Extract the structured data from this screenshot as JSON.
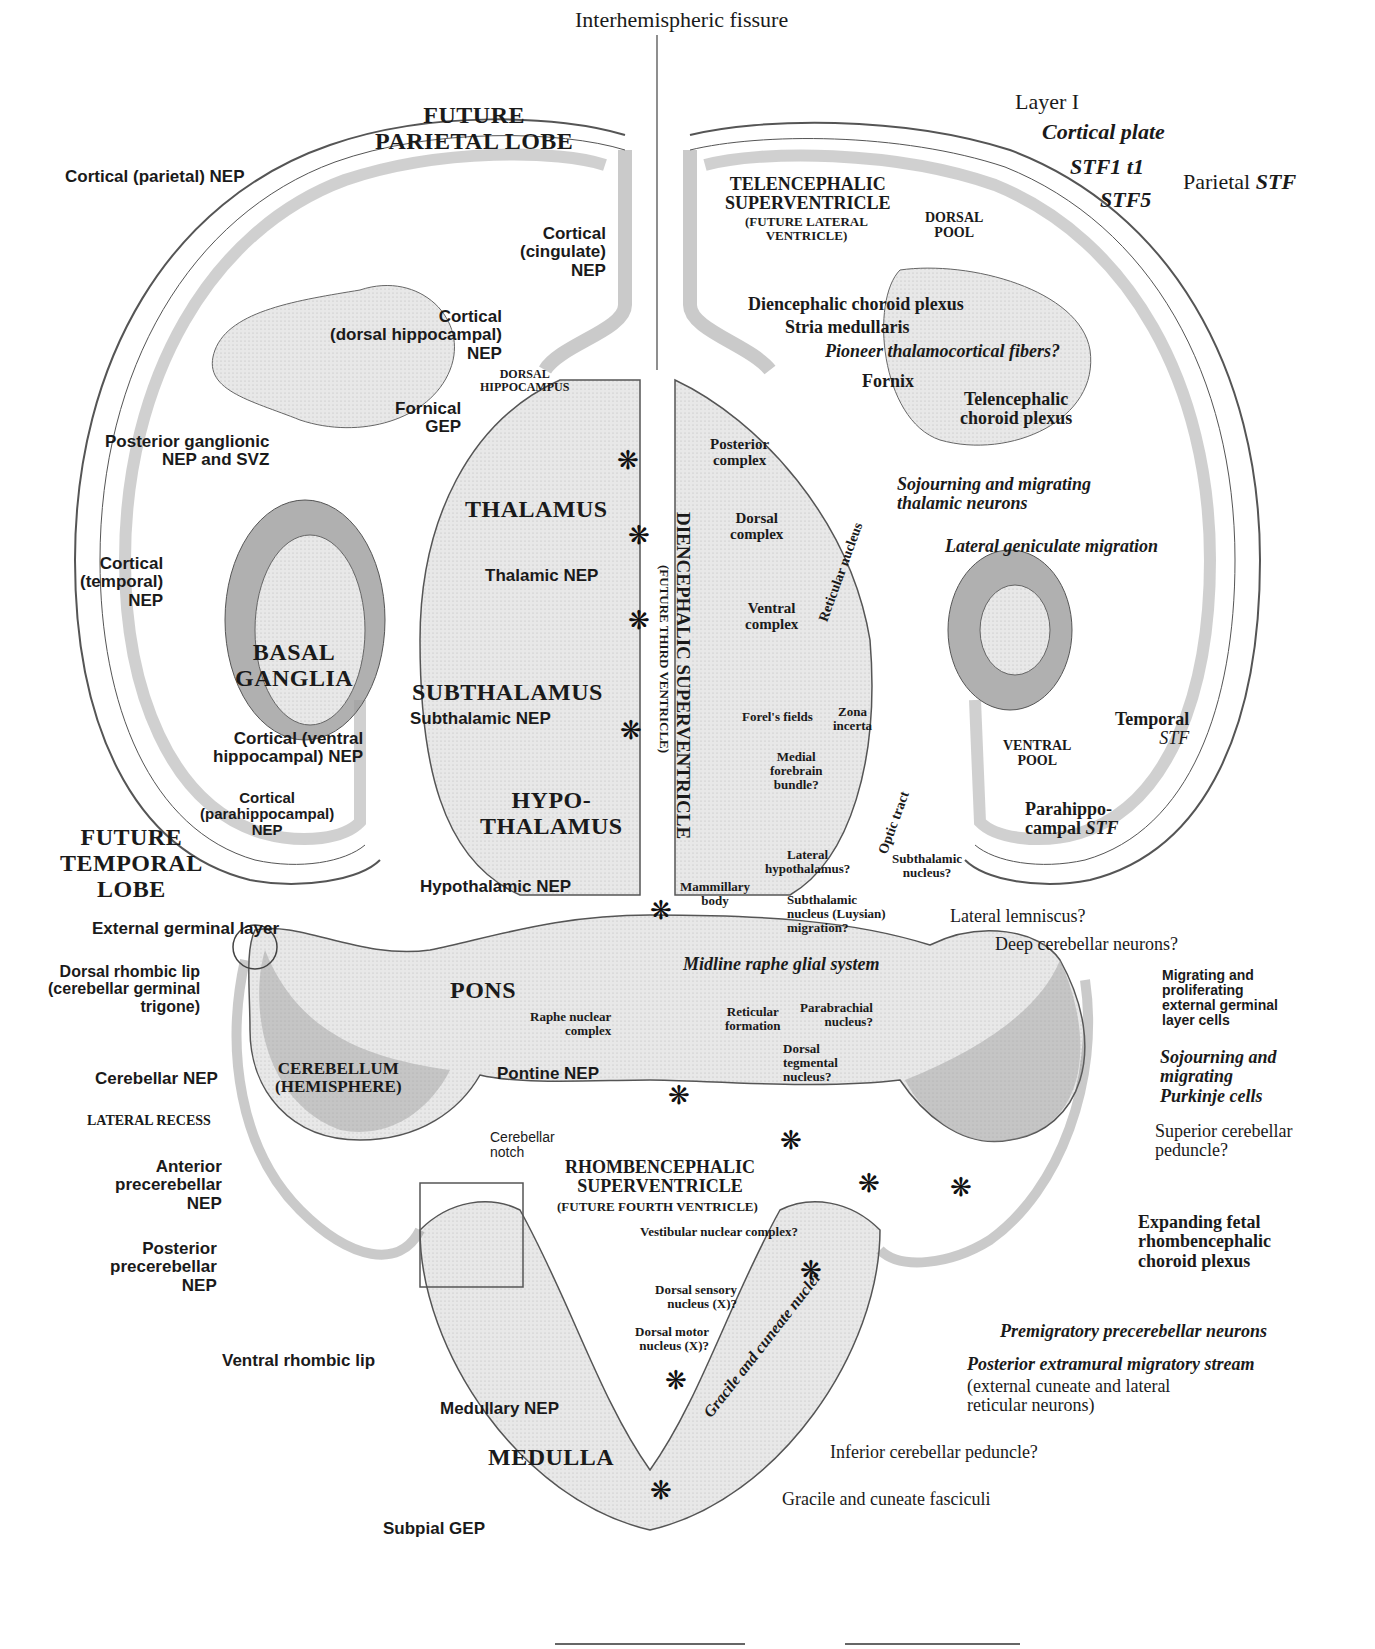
{
  "diagram": {
    "colors": {
      "tissue_light": "#e6e6e6",
      "tissue_dark": "#9c9c9c",
      "outline": "#555555",
      "text": "#1a1a1a",
      "background": "#ffffff"
    },
    "top": {
      "interhemispheric": "Interhemispheric fissure",
      "parietal_lobe": "FUTURE\nPARIETAL LOBE",
      "layer1": "Layer I",
      "cortical_plate": "Cortical plate",
      "stf1": "STF1 t1",
      "stf5": "STF5",
      "parietal_stf_prefix": "Parietal ",
      "parietal_stf_suffix": "STF",
      "tel_superventricle": "TELENCEPHALIC\nSUPERVENTRICLE",
      "tel_future": "(FUTURE LATERAL\nVENTRICLE)",
      "dorsal_pool": "DORSAL\nPOOL"
    },
    "left": {
      "cortical_parietal": "Cortical (parietal) NEP",
      "cortical_cingulate": "Cortical\n(cingulate)\nNEP",
      "cortical_dorsal_hippo": "Cortical\n(dorsal hippocampal)\nNEP",
      "dorsal_hippocampus": "DORSAL\nHIPPOCAMPUS",
      "fornical_gep": "Fornical\nGEP",
      "posterior_ganglionic": "Posterior ganglionic\nNEP and SVZ",
      "thalamus": "THALAMUS",
      "cortical_temporal": "Cortical\n(temporal)\nNEP",
      "thalamic_nep": "Thalamic NEP",
      "basal_ganglia": "BASAL\nGANGLIA",
      "subthalamus": "SUBTHALAMUS",
      "subthalamic_nep": "Subthalamic NEP",
      "cortical_ventral_hippo": "Cortical (ventral\nhippocampal) NEP",
      "hypothalamus": "HYPO-\nTHALAMUS",
      "cortical_parahippo": "Cortical\n(parahippocampal)\nNEP",
      "temporal_lobe": "FUTURE\nTEMPORAL\nLOBE",
      "hypothalamic_nep": "Hypothalamic NEP"
    },
    "center": {
      "dien_superventricle": "DIENCEPHALIC SUPERVENTRICLE",
      "dien_future": "(FUTURE THIRD VENTRICLE)"
    },
    "right": {
      "dien_choroid": "Diencephalic choroid plexus",
      "stria": "Stria medullaris",
      "pioneer": "Pioneer thalamocortical fibers?",
      "fornix": "Fornix",
      "tel_choroid": "Telencephalic\nchoroid plexus",
      "posterior_complex": "Posterior\ncomplex",
      "sojourning_thalamic": "Sojourning and migrating\nthalamic neurons",
      "dorsal_complex": "Dorsal\ncomplex",
      "reticular_nucleus": "Reticular nucleus",
      "lateral_geniculate": "Lateral geniculate migration",
      "ventral_complex": "Ventral\ncomplex",
      "forels_fields": "Forel's fields",
      "zona_incerta": "Zona\nincerta",
      "temporal_stf_1": "Temporal",
      "temporal_stf_2": "STF",
      "ventral_pool": "VENTRAL\nPOOL",
      "medial_forebrain": "Medial\nforebrain\nbundle?",
      "optic_tract": "Optic tract",
      "parahippo_stf_1": "Parahippo-",
      "parahippo_stf_2": "campal ",
      "parahippo_stf_3": "STF",
      "lateral_hypothalamus": "Lateral\nhypothalamus?",
      "subthalamic_nucleus": "Subthalamic\nnucleus?",
      "mammillary": "Mammillary\nbody",
      "luysian": "Subthalamic\nnucleus (Luysian)\nmigration?"
    },
    "hindbrain": {
      "external_germinal": "External germinal layer",
      "lateral_lemniscus": "Lateral lemniscus?",
      "deep_cerebellar": "Deep cerebellar neurons?",
      "midline_raphe": "Midline raphe glial system",
      "dorsal_rhombic_lip": "Dorsal rhombic lip\n(cerebellar germinal\ntrigone)",
      "pons": "PONS",
      "migrating_egl": "Migrating and\nproliferating\nexternal germinal\nlayer cells",
      "raphe_nuclear": "Raphe nuclear\ncomplex",
      "reticular_formation": "Reticular\nformation",
      "parabrachial": "Parabrachial\nnucleus?",
      "sojourning_purkinje": "Sojourning and\nmigrating\nPurkinje cells",
      "dorsal_tegmental": "Dorsal\ntegmental\nnucleus?",
      "cerebellar_nep": "Cerebellar NEP",
      "cerebellum": "CEREBELLUM\n(HEMISPHERE)",
      "pontine_nep": "Pontine NEP",
      "lateral_recess": "LATERAL RECESS",
      "superior_cerebellar": "Superior cerebellar\npeduncle?",
      "cerebellar_notch": "Cerebellar\nnotch",
      "rhomb_superventricle": "RHOMBENCEPHALIC\nSUPERVENTRICLE",
      "rhomb_future": "(FUTURE FOURTH VENTRICLE)",
      "anterior_precereb": "Anterior\nprecerebellar\nNEP",
      "expanding_choroid": "Expanding fetal\nrhombencephalic\nchoroid plexus",
      "vestibular": "Vestibular nuclear complex?",
      "posterior_precereb": "Posterior\nprecerebellar\nNEP",
      "dorsal_sensory": "Dorsal sensory\nnucleus (X)?",
      "premigratory": "Premigratory precerebellar neurons",
      "dorsal_motor": "Dorsal motor\nnucleus (X)?",
      "ventral_rhombic_lip": "Ventral rhombic lip",
      "posterior_extramural": "Posterior extramural migratory stream",
      "posterior_extramural_sub": "(external cuneate and lateral\nreticular neurons)",
      "medullary_nep": "Medullary NEP",
      "gracile_cuneate_nuclei": "Gracile and cuneate nuclei",
      "medulla": "MEDULLA",
      "inferior_cerebellar": "Inferior cerebellar peduncle?",
      "gracile_fasciculi": "Gracile and cuneate fasciculi",
      "subpial_gep": "Subpial GEP"
    },
    "star_glyph": "❋"
  }
}
